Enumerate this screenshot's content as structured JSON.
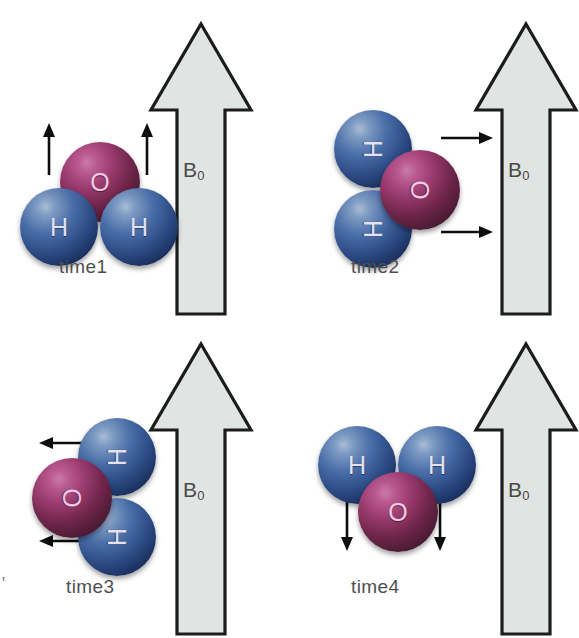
{
  "figure": {
    "field_label": "B",
    "field_subscript": "0",
    "atom_oxygen_label": "O",
    "atom_hydrogen_label": "H",
    "colors": {
      "hydrogen": "#2d4c86",
      "oxygen": "#993a6e",
      "arrow_fill": "#e0e4e2",
      "arrow_stroke": "#1a1a1a",
      "text": "#4f4f4f",
      "background": "#ffffff"
    },
    "scan_mark": "'",
    "panels": [
      {
        "id": "time1",
        "caption": "time1",
        "field_label": "B",
        "field_subscript": "0",
        "orientation_deg": 0,
        "motion_arrow_direction": "up",
        "motion_arrow_count": 2,
        "atoms": [
          {
            "element": "O",
            "label": "O"
          },
          {
            "element": "H",
            "label": "H"
          },
          {
            "element": "H",
            "label": "H"
          }
        ]
      },
      {
        "id": "time2",
        "caption": "time2",
        "field_label": "B",
        "field_subscript": "0",
        "orientation_deg": 90,
        "motion_arrow_direction": "right",
        "motion_arrow_count": 2,
        "atoms": [
          {
            "element": "O",
            "label": "O"
          },
          {
            "element": "H",
            "label": "H"
          },
          {
            "element": "H",
            "label": "H"
          }
        ]
      },
      {
        "id": "time3",
        "caption": "time3",
        "field_label": "B",
        "field_subscript": "0",
        "orientation_deg": 270,
        "motion_arrow_direction": "left",
        "motion_arrow_count": 2,
        "atoms": [
          {
            "element": "O",
            "label": "O"
          },
          {
            "element": "H",
            "label": "H"
          },
          {
            "element": "H",
            "label": "H"
          }
        ]
      },
      {
        "id": "time4",
        "caption": "time4",
        "field_label": "B",
        "field_subscript": "0",
        "orientation_deg": 180,
        "motion_arrow_direction": "down",
        "motion_arrow_count": 2,
        "atoms": [
          {
            "element": "O",
            "label": "O"
          },
          {
            "element": "H",
            "label": "H"
          },
          {
            "element": "H",
            "label": "H"
          }
        ]
      }
    ]
  }
}
